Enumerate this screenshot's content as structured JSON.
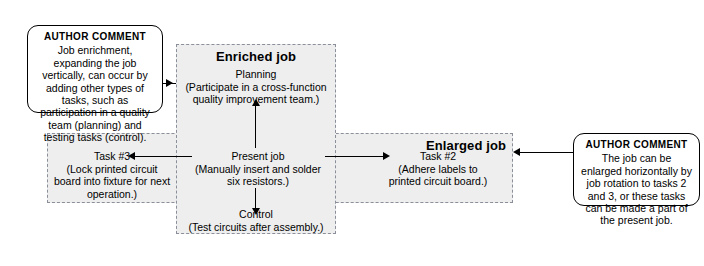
{
  "diagram": {
    "regions": [
      {
        "id": "enriched",
        "title": "Enriched job"
      },
      {
        "id": "enlarged",
        "title": "Enlarged job"
      }
    ],
    "nodes": [
      {
        "id": "planning",
        "label": "Planning",
        "detail": "(Participate in a cross-function quality improvement team.)"
      },
      {
        "id": "present-job",
        "label": "Present job",
        "detail": "(Manually insert and solder six resistors.)"
      },
      {
        "id": "control",
        "label": "Control",
        "detail": "(Test circuits after assembly.)"
      },
      {
        "id": "task-3",
        "label": "Task #3",
        "detail": "(Lock printed circuit board into fixture for next operation.)"
      },
      {
        "id": "task-2",
        "label": "Task #2",
        "detail": "(Adhere labels to printed circuit board.)"
      }
    ],
    "callouts": [
      {
        "id": "left",
        "heading": "AUTHOR COMMENT",
        "body": "Job enrichment, expanding the job vertically, can occur by adding other types of tasks, such as participation in a quality team (planning) and testing tasks (control)."
      },
      {
        "id": "right",
        "heading": "AUTHOR COMMENT",
        "body": "The job can be enlarged horizontally by job rotation to tasks 2 and 3, or these tasks can be made a part of the present job."
      }
    ],
    "colors": {
      "region_fill": "#eeeeee",
      "region_border": "#8a8f99",
      "callout_border": "#000000",
      "connector": "#000000",
      "background": "#ffffff"
    }
  }
}
